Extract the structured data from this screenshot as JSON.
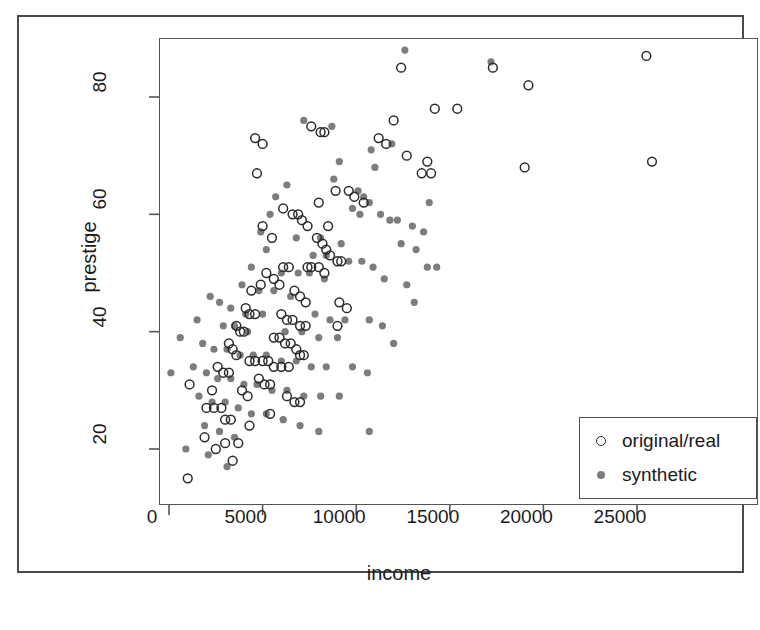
{
  "chart_data": {
    "type": "scatter",
    "title": "",
    "xlabel": "income",
    "ylabel": "prestige",
    "xlim": [
      -560,
      26500
    ],
    "ylim": [
      13,
      90
    ],
    "xticks": [
      0,
      5000,
      10000,
      15000,
      20000,
      25000
    ],
    "xtick_labels": [
      "0",
      "5000",
      "10000",
      "15000",
      "20000",
      "25000"
    ],
    "yticks": [
      20,
      40,
      60,
      80
    ],
    "ytick_labels": [
      "20",
      "40",
      "60",
      "80"
    ],
    "grid": false,
    "legend_position": "bottom-right",
    "series": [
      {
        "name": "original/real",
        "marker": "open-circle",
        "color": "#2b2b2b",
        "fill": "none",
        "points": [
          [
            25500,
            87
          ],
          [
            25800,
            69
          ],
          [
            19200,
            82
          ],
          [
            17300,
            85
          ],
          [
            12400,
            85
          ],
          [
            14200,
            78
          ],
          [
            15400,
            78
          ],
          [
            12000,
            76
          ],
          [
            11200,
            73
          ],
          [
            11600,
            72
          ],
          [
            12700,
            70
          ],
          [
            13800,
            69
          ],
          [
            19000,
            68
          ],
          [
            14000,
            67
          ],
          [
            13500,
            67
          ],
          [
            4600,
            73
          ],
          [
            5000,
            72
          ],
          [
            7600,
            75
          ],
          [
            8100,
            74
          ],
          [
            8300,
            74
          ],
          [
            4700,
            67
          ],
          [
            8900,
            64
          ],
          [
            9600,
            64
          ],
          [
            9900,
            63
          ],
          [
            8000,
            62
          ],
          [
            10400,
            62
          ],
          [
            6100,
            61
          ],
          [
            6600,
            60
          ],
          [
            6900,
            60
          ],
          [
            7100,
            59
          ],
          [
            7400,
            58
          ],
          [
            5000,
            58
          ],
          [
            8500,
            58
          ],
          [
            5500,
            56
          ],
          [
            7900,
            56
          ],
          [
            8200,
            55
          ],
          [
            8400,
            54
          ],
          [
            8600,
            53
          ],
          [
            9000,
            52
          ],
          [
            9200,
            52
          ],
          [
            6100,
            51
          ],
          [
            6400,
            51
          ],
          [
            7400,
            51
          ],
          [
            7600,
            51
          ],
          [
            8000,
            51
          ],
          [
            8300,
            50
          ],
          [
            5200,
            50
          ],
          [
            5600,
            49
          ],
          [
            5900,
            48
          ],
          [
            4900,
            48
          ],
          [
            4400,
            47
          ],
          [
            6700,
            47
          ],
          [
            7000,
            46
          ],
          [
            7300,
            45
          ],
          [
            9100,
            45
          ],
          [
            9500,
            44
          ],
          [
            4100,
            44
          ],
          [
            4300,
            43
          ],
          [
            4600,
            43
          ],
          [
            6000,
            43
          ],
          [
            6300,
            42
          ],
          [
            6600,
            42
          ],
          [
            7000,
            41
          ],
          [
            7300,
            41
          ],
          [
            9000,
            41
          ],
          [
            3600,
            41
          ],
          [
            3800,
            40
          ],
          [
            4000,
            40
          ],
          [
            5600,
            39
          ],
          [
            5900,
            39
          ],
          [
            6200,
            38
          ],
          [
            6500,
            38
          ],
          [
            6800,
            37
          ],
          [
            3200,
            38
          ],
          [
            3400,
            37
          ],
          [
            3600,
            36
          ],
          [
            7000,
            36
          ],
          [
            7200,
            36
          ],
          [
            4300,
            35
          ],
          [
            4600,
            35
          ],
          [
            5000,
            35
          ],
          [
            5300,
            35
          ],
          [
            5600,
            34
          ],
          [
            6000,
            34
          ],
          [
            6400,
            34
          ],
          [
            2600,
            34
          ],
          [
            2900,
            33
          ],
          [
            3200,
            33
          ],
          [
            4800,
            32
          ],
          [
            5100,
            31
          ],
          [
            5400,
            31
          ],
          [
            1100,
            31
          ],
          [
            2300,
            30
          ],
          [
            3900,
            30
          ],
          [
            4200,
            29
          ],
          [
            6300,
            29
          ],
          [
            6700,
            28
          ],
          [
            7000,
            28
          ],
          [
            2000,
            27
          ],
          [
            2400,
            27
          ],
          [
            2800,
            27
          ],
          [
            5400,
            26
          ],
          [
            3000,
            25
          ],
          [
            3300,
            25
          ],
          [
            4300,
            24
          ],
          [
            1900,
            22
          ],
          [
            3000,
            21
          ],
          [
            3700,
            21
          ],
          [
            2500,
            20
          ],
          [
            3400,
            18
          ],
          [
            1000,
            15
          ]
        ]
      },
      {
        "name": "synthetic",
        "marker": "filled-circle",
        "color": "#7d7d7d",
        "fill": "#7d7d7d",
        "points": [
          [
            12600,
            88
          ],
          [
            17200,
            86
          ],
          [
            7200,
            76
          ],
          [
            8700,
            75
          ],
          [
            11900,
            72
          ],
          [
            10800,
            71
          ],
          [
            9100,
            69
          ],
          [
            11000,
            68
          ],
          [
            13900,
            62
          ],
          [
            8800,
            66
          ],
          [
            6300,
            65
          ],
          [
            5700,
            63
          ],
          [
            10100,
            64
          ],
          [
            10400,
            63
          ],
          [
            10700,
            62
          ],
          [
            11300,
            60
          ],
          [
            11800,
            59
          ],
          [
            5400,
            60
          ],
          [
            9800,
            61
          ],
          [
            10200,
            60
          ],
          [
            12200,
            59
          ],
          [
            13000,
            58
          ],
          [
            13600,
            57
          ],
          [
            4900,
            57
          ],
          [
            6800,
            56
          ],
          [
            8100,
            56
          ],
          [
            9200,
            55
          ],
          [
            12400,
            55
          ],
          [
            13200,
            54
          ],
          [
            5200,
            54
          ],
          [
            7700,
            53
          ],
          [
            8400,
            53
          ],
          [
            9600,
            52
          ],
          [
            10300,
            52
          ],
          [
            10900,
            51
          ],
          [
            13800,
            51
          ],
          [
            14300,
            51
          ],
          [
            4400,
            51
          ],
          [
            6000,
            50
          ],
          [
            6900,
            50
          ],
          [
            7500,
            50
          ],
          [
            8300,
            49
          ],
          [
            11500,
            49
          ],
          [
            12700,
            48
          ],
          [
            3900,
            48
          ],
          [
            4800,
            47
          ],
          [
            5600,
            47
          ],
          [
            6500,
            46
          ],
          [
            13100,
            45
          ],
          [
            2200,
            46
          ],
          [
            2700,
            45
          ],
          [
            1500,
            42
          ],
          [
            3300,
            44
          ],
          [
            4100,
            43
          ],
          [
            5000,
            43
          ],
          [
            7800,
            43
          ],
          [
            8600,
            42
          ],
          [
            9400,
            42
          ],
          [
            10700,
            42
          ],
          [
            11400,
            41
          ],
          [
            2900,
            41
          ],
          [
            3500,
            41
          ],
          [
            4200,
            40
          ],
          [
            6200,
            40
          ],
          [
            7100,
            40
          ],
          [
            8000,
            39
          ],
          [
            9000,
            39
          ],
          [
            12000,
            38
          ],
          [
            600,
            39
          ],
          [
            1800,
            38
          ],
          [
            2400,
            37
          ],
          [
            3100,
            37
          ],
          [
            3800,
            36
          ],
          [
            4500,
            36
          ],
          [
            5200,
            36
          ],
          [
            6000,
            35
          ],
          [
            6800,
            35
          ],
          [
            7600,
            34
          ],
          [
            8400,
            34
          ],
          [
            9800,
            34
          ],
          [
            10600,
            33
          ],
          [
            1300,
            34
          ],
          [
            2000,
            33
          ],
          [
            2600,
            32
          ],
          [
            3300,
            32
          ],
          [
            4000,
            31
          ],
          [
            4700,
            31
          ],
          [
            5500,
            30
          ],
          [
            6300,
            30
          ],
          [
            7200,
            29
          ],
          [
            8100,
            29
          ],
          [
            9100,
            29
          ],
          [
            100,
            33
          ],
          [
            1600,
            29
          ],
          [
            2300,
            28
          ],
          [
            3000,
            28
          ],
          [
            3700,
            27
          ],
          [
            4400,
            26
          ],
          [
            5200,
            26
          ],
          [
            6100,
            25
          ],
          [
            7000,
            24
          ],
          [
            8000,
            23
          ],
          [
            10700,
            23
          ],
          [
            1900,
            24
          ],
          [
            2700,
            23
          ],
          [
            3500,
            22
          ],
          [
            900,
            20
          ],
          [
            2100,
            19
          ],
          [
            3100,
            17
          ]
        ]
      }
    ]
  },
  "legend": {
    "items": [
      {
        "label": "original/real",
        "marker": "open-circle"
      },
      {
        "label": "synthetic",
        "marker": "filled-circle"
      }
    ]
  },
  "colors": {
    "frame": "#555555",
    "page_border": "#4a4a4a",
    "real_marker": "#2b2b2b",
    "synthetic_marker": "#7d7d7d",
    "text": "#1c1c1c",
    "background": "#ffffff"
  }
}
